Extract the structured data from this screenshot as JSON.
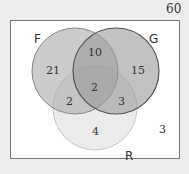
{
  "diagram": {
    "type": "venn-3",
    "universe_total": "60",
    "sets": [
      {
        "name": "F",
        "label": "F"
      },
      {
        "name": "G",
        "label": "G"
      },
      {
        "name": "R",
        "label": "R"
      }
    ],
    "regions": {
      "F_only": "21",
      "G_only": "15",
      "R_only": "4",
      "F_G_only": "10",
      "F_R_only": "2",
      "G_R_only": "3",
      "F_G_R": "2",
      "none": "3"
    },
    "colors": {
      "background": "#ededed",
      "box": "#ffffff",
      "F_fill": "#b8b8b8",
      "G_fill": "#a8a8a8",
      "R_fill": "#e4e4e4"
    }
  }
}
